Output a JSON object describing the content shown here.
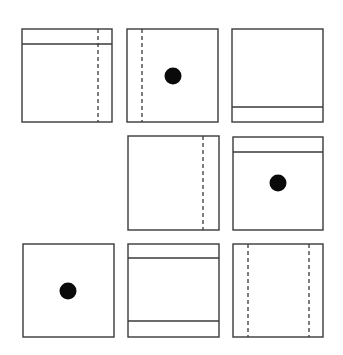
{
  "puzzle": {
    "type": "3x3 visual pattern matrix",
    "stroke_color": "#3a3a3a",
    "dot_color": "#0a0a0a",
    "background": "#ffffff",
    "cells": [
      {
        "row": 1,
        "col": 1,
        "present": true,
        "box": [
          22,
          29,
          112,
          122
        ],
        "features": {
          "h_lines": [
            {
              "y": 44
            }
          ],
          "dashed_v": [
            {
              "x": 98
            }
          ],
          "dot": null
        }
      },
      {
        "row": 1,
        "col": 2,
        "present": true,
        "box": [
          127,
          29,
          218,
          122
        ],
        "features": {
          "h_lines": [],
          "dashed_v": [
            {
              "x": 142
            }
          ],
          "dot": {
            "cx": 173,
            "cy": 76,
            "r": 8.5
          }
        }
      },
      {
        "row": 1,
        "col": 3,
        "present": true,
        "box": [
          232,
          29,
          323,
          122
        ],
        "features": {
          "h_lines": [
            {
              "y": 107
            }
          ],
          "dashed_v": [],
          "dot": null
        }
      },
      {
        "row": 2,
        "col": 1,
        "present": false,
        "box": null,
        "features": null
      },
      {
        "row": 2,
        "col": 2,
        "present": true,
        "box": [
          128,
          136,
          219,
          230
        ],
        "features": {
          "h_lines": [],
          "dashed_v": [
            {
              "x": 203
            }
          ],
          "dot": null
        }
      },
      {
        "row": 2,
        "col": 3,
        "present": true,
        "box": [
          233,
          137,
          323,
          230
        ],
        "features": {
          "h_lines": [
            {
              "y": 152
            }
          ],
          "dashed_v": [],
          "dot": {
            "cx": 278,
            "cy": 183,
            "r": 8.5
          }
        }
      },
      {
        "row": 3,
        "col": 1,
        "present": true,
        "box": [
          23,
          244,
          114,
          337
        ],
        "features": {
          "h_lines": [],
          "dashed_v": [],
          "dot": {
            "cx": 68,
            "cy": 291,
            "r": 8.5
          }
        }
      },
      {
        "row": 3,
        "col": 2,
        "present": true,
        "box": [
          128,
          244,
          219,
          337
        ],
        "features": {
          "h_lines": [
            {
              "y": 258
            },
            {
              "y": 321
            }
          ],
          "dashed_v": [],
          "dot": null
        }
      },
      {
        "row": 3,
        "col": 3,
        "present": true,
        "box": [
          233,
          244,
          323,
          337
        ],
        "features": {
          "h_lines": [],
          "dashed_v": [
            {
              "x": 248
            },
            {
              "x": 309
            }
          ],
          "dot": null
        }
      }
    ]
  }
}
